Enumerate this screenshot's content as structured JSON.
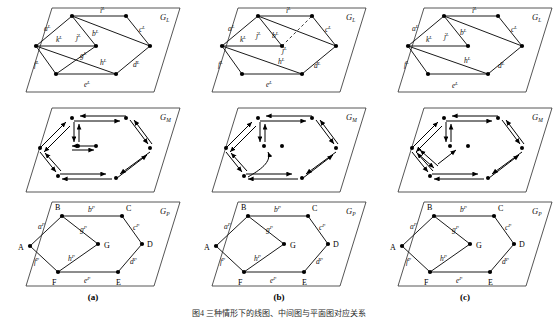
{
  "figure": {
    "caption": "图4 三种情形下的线图、中间图与平面图对应关系",
    "columns": [
      {
        "key": "a",
        "label": "(a)"
      },
      {
        "key": "b",
        "label": "(b)"
      },
      {
        "key": "c",
        "label": "(c)"
      }
    ],
    "rows": [
      {
        "key": "L",
        "graph_label": "G",
        "graph_sub": "L"
      },
      {
        "key": "M",
        "graph_label": "G",
        "graph_sub": "M"
      },
      {
        "key": "P",
        "graph_label": "G",
        "graph_sub": "P"
      }
    ],
    "colors": {
      "stroke": "#1a1a1a",
      "plane": "#2b2b2b",
      "background": "#ffffff",
      "node": "#000000",
      "dashed": "#3a3a3a"
    }
  },
  "labels": {
    "line_edges": [
      "a",
      "b",
      "c",
      "d",
      "e",
      "f",
      "g",
      "h",
      "i",
      "j",
      "k"
    ],
    "line_superscript": "L",
    "planar_superscript": "P",
    "planar_vertices": [
      "A",
      "B",
      "C",
      "D",
      "E",
      "F",
      "G"
    ],
    "graph_L": "G",
    "graph_L_sub": "L",
    "graph_M": "G",
    "graph_M_sub": "M",
    "graph_P": "G",
    "graph_P_sub": "P"
  },
  "panels": {
    "a_L": {
      "name": "line-graph-a",
      "nodes": {
        "n_top": [
          72,
          16
        ],
        "n_left": [
          36,
          46
        ],
        "n_mid": [
          96,
          46
        ],
        "n_right": [
          150,
          46
        ],
        "n_bl": [
          56,
          74
        ],
        "n_br": [
          116,
          74
        ],
        "n_tr": [
          126,
          16
        ]
      },
      "edges": [
        {
          "id": "aL",
          "from": "n_top",
          "to": "n_left",
          "label": "a",
          "lx": 44,
          "ly": 29
        },
        {
          "id": "kL",
          "from": "n_left",
          "to": "n_mid",
          "label": "k",
          "lx": 59,
          "ly": 40
        },
        {
          "id": "jL",
          "from": "n_top",
          "to": "n_mid",
          "label": "j",
          "lx": 80,
          "ly": 38
        },
        {
          "id": "bL",
          "from": "n_top",
          "to": "n_right",
          "label": "b",
          "lx": 97,
          "ly": 34
        },
        {
          "id": "iL",
          "from": "n_top",
          "to": "n_tr",
          "label": "i",
          "lx": 100,
          "ly": 13
        },
        {
          "id": "cL",
          "from": "n_tr",
          "to": "n_right",
          "label": "c",
          "lx": 141,
          "ly": 31
        },
        {
          "id": "gL",
          "from": "n_left",
          "to": "n_br",
          "label": "g",
          "lx": 88,
          "ly": 56
        },
        {
          "id": "fL",
          "from": "n_left",
          "to": "n_bl",
          "label": "f",
          "lx": 38,
          "ly": 66
        },
        {
          "id": "hL",
          "from": "n_mid",
          "to": "n_bl",
          "label": "h",
          "lx": 103,
          "ly": 64
        },
        {
          "id": "eL",
          "from": "n_bl",
          "to": "n_br",
          "label": "e",
          "lx": 85,
          "ly": 84
        },
        {
          "id": "dL",
          "from": "n_br",
          "to": "n_right",
          "label": "d",
          "lx": 137,
          "ly": 64
        }
      ],
      "dashed": []
    },
    "b_L": {
      "name": "line-graph-b",
      "nodes": {
        "n_top": [
          72,
          16
        ],
        "n_left": [
          36,
          46
        ],
        "n_mid": [
          96,
          46
        ],
        "n_right": [
          150,
          46
        ],
        "n_bl": [
          56,
          74
        ],
        "n_br": [
          116,
          74
        ],
        "n_tr": [
          126,
          16
        ]
      },
      "edges": [
        {
          "id": "aL",
          "from": "n_top",
          "to": "n_left",
          "label": "a",
          "lx": 44,
          "ly": 29
        },
        {
          "id": "kL",
          "from": "n_left",
          "to": "n_mid",
          "label": "k",
          "lx": 59,
          "ly": 40
        },
        {
          "id": "jL_d",
          "from": "n_mid",
          "to": "n_tr",
          "label": "j",
          "lx": 104,
          "ly": 52,
          "dashed": true
        },
        {
          "id": "bL",
          "from": "n_top",
          "to": "n_mid",
          "label": "b",
          "lx": 84,
          "ly": 37
        },
        {
          "id": "iL",
          "from": "n_top",
          "to": "n_tr",
          "label": "i",
          "lx": 100,
          "ly": 13
        },
        {
          "id": "cL",
          "from": "n_tr",
          "to": "n_right",
          "label": "c",
          "lx": 141,
          "ly": 31
        },
        {
          "id": "gL",
          "from": "n_top",
          "to": "n_right",
          "label": "",
          "lx": 0,
          "ly": 0
        },
        {
          "id": "fL",
          "from": "n_left",
          "to": "n_bl",
          "label": "f",
          "lx": 38,
          "ly": 66
        },
        {
          "id": "hL",
          "from": "n_left",
          "to": "n_br",
          "label": "h",
          "lx": 95,
          "ly": 63
        },
        {
          "id": "eL",
          "from": "n_bl",
          "to": "n_br",
          "label": "e",
          "lx": 85,
          "ly": 84
        },
        {
          "id": "dL",
          "from": "n_br",
          "to": "n_right",
          "label": "d",
          "lx": 137,
          "ly": 66
        }
      ]
    },
    "c_L": {
      "name": "line-graph-c",
      "nodes": {
        "n_top": [
          72,
          16
        ],
        "n_left": [
          36,
          46
        ],
        "n_mid": [
          96,
          46
        ],
        "n_right": [
          150,
          46
        ],
        "n_bl": [
          56,
          74
        ],
        "n_br": [
          116,
          74
        ],
        "n_tr": [
          126,
          16
        ]
      },
      "edges": [
        {
          "id": "aL",
          "from": "n_top",
          "to": "n_left",
          "label": "a",
          "lx": 44,
          "ly": 29
        },
        {
          "id": "kL",
          "from": "n_left",
          "to": "n_mid",
          "label": "k",
          "lx": 59,
          "ly": 41
        },
        {
          "id": "jL",
          "from": "n_top",
          "to": "n_mid",
          "label": "j",
          "lx": 78,
          "ly": 38
        },
        {
          "id": "bL",
          "from": "n_top",
          "to": "n_mid",
          "label": "b",
          "lx": 92,
          "ly": 33
        },
        {
          "id": "iL",
          "from": "n_top",
          "to": "n_tr",
          "label": "i",
          "lx": 100,
          "ly": 13
        },
        {
          "id": "cL",
          "from": "n_tr",
          "to": "n_right",
          "label": "c",
          "lx": 141,
          "ly": 31
        },
        {
          "id": "bL2",
          "from": "n_top",
          "to": "n_right",
          "label": "",
          "lx": 0,
          "ly": 0
        },
        {
          "id": "fL",
          "from": "n_left",
          "to": "n_bl",
          "label": "f",
          "lx": 38,
          "ly": 66
        },
        {
          "id": "hL",
          "from": "n_left",
          "to": "n_br",
          "label": "h",
          "lx": 95,
          "ly": 63
        },
        {
          "id": "eL",
          "from": "n_bl",
          "to": "n_br",
          "label": "e",
          "lx": 85,
          "ly": 84
        },
        {
          "id": "dL",
          "from": "n_br",
          "to": "n_right",
          "label": "d",
          "lx": 134,
          "ly": 66
        }
      ]
    },
    "a_M": {
      "name": "medial-graph-a",
      "nodes": [
        [
          72,
          18
        ],
        [
          126,
          18
        ],
        [
          40,
          48
        ],
        [
          96,
          46
        ],
        [
          150,
          48
        ],
        [
          58,
          76
        ],
        [
          116,
          78
        ]
      ],
      "description": "directed medial graph with paired opposite arcs"
    },
    "b_M": {
      "name": "medial-graph-b",
      "nodes": [
        [
          72,
          18
        ],
        [
          126,
          18
        ],
        [
          40,
          48
        ],
        [
          96,
          46
        ],
        [
          150,
          48
        ],
        [
          58,
          76
        ],
        [
          116,
          78
        ]
      ],
      "description": "directed medial graph with curved loop arc"
    },
    "c_M": {
      "name": "medial-graph-c",
      "nodes": [
        [
          72,
          18
        ],
        [
          126,
          18
        ],
        [
          40,
          48
        ],
        [
          96,
          46
        ],
        [
          150,
          48
        ],
        [
          58,
          76
        ],
        [
          116,
          78
        ]
      ],
      "description": "directed medial graph with inner quadrilateral"
    },
    "a_P": {
      "name": "planar-graph-a",
      "vertices": {
        "A": [
          30,
          52
        ],
        "B": [
          62,
          22
        ],
        "C": [
          122,
          22
        ],
        "D": [
          142,
          50
        ],
        "E": [
          118,
          78
        ],
        "F": [
          58,
          78
        ],
        "G": [
          98,
          50
        ]
      },
      "edges": [
        {
          "id": "aP",
          "from": "A",
          "to": "B",
          "label": "a",
          "lx": 42,
          "ly": 34
        },
        {
          "id": "bP",
          "from": "B",
          "to": "C",
          "label": "b",
          "lx": 92,
          "ly": 18
        },
        {
          "id": "cP",
          "from": "C",
          "to": "D",
          "label": "c",
          "lx": 137,
          "ly": 34
        },
        {
          "id": "dP",
          "from": "D",
          "to": "E",
          "label": "d",
          "lx": 136,
          "ly": 68
        },
        {
          "id": "eP",
          "from": "E",
          "to": "F",
          "label": "e",
          "lx": 88,
          "ly": 86
        },
        {
          "id": "fP",
          "from": "F",
          "to": "A",
          "label": "f",
          "lx": 39,
          "ly": 68
        },
        {
          "id": "gP",
          "from": "B",
          "to": "G",
          "label": "g",
          "lx": 84,
          "ly": 36
        },
        {
          "id": "hP",
          "from": "G",
          "to": "F",
          "label": "h",
          "lx": 74,
          "ly": 64
        }
      ],
      "vertex_label_pos": {
        "A": [
          20,
          55
        ],
        "B": [
          57,
          16
        ],
        "C": [
          127,
          16
        ],
        "D": [
          147,
          53
        ],
        "E": [
          118,
          90
        ],
        "F": [
          54,
          90
        ],
        "G": [
          104,
          54
        ]
      }
    },
    "b_P": {
      "name": "planar-graph-b",
      "vertices": {
        "A": [
          30,
          52
        ],
        "B": [
          62,
          22
        ],
        "C": [
          122,
          22
        ],
        "D": [
          142,
          50
        ],
        "E": [
          118,
          78
        ],
        "F": [
          58,
          78
        ],
        "G": [
          98,
          50
        ]
      },
      "edges": [
        {
          "id": "aP",
          "from": "A",
          "to": "B",
          "label": "a",
          "lx": 42,
          "ly": 34
        },
        {
          "id": "bP",
          "from": "B",
          "to": "C",
          "label": "b",
          "lx": 92,
          "ly": 18
        },
        {
          "id": "cP",
          "from": "C",
          "to": "D",
          "label": "c",
          "lx": 137,
          "ly": 34
        },
        {
          "id": "dP",
          "from": "D",
          "to": "E",
          "label": "d",
          "lx": 136,
          "ly": 68
        },
        {
          "id": "eP",
          "from": "E",
          "to": "F",
          "label": "e",
          "lx": 88,
          "ly": 86
        },
        {
          "id": "fP",
          "from": "F",
          "to": "A",
          "label": "f",
          "lx": 39,
          "ly": 68
        },
        {
          "id": "gP",
          "from": "B",
          "to": "G",
          "label": "g",
          "lx": 84,
          "ly": 36
        },
        {
          "id": "hP",
          "from": "G",
          "to": "F",
          "label": "h",
          "lx": 74,
          "ly": 64
        }
      ],
      "vertex_label_pos": {
        "A": [
          20,
          55
        ],
        "B": [
          57,
          16
        ],
        "C": [
          127,
          16
        ],
        "D": [
          147,
          53
        ],
        "E": [
          118,
          90
        ],
        "F": [
          54,
          90
        ],
        "G": [
          104,
          54
        ]
      }
    },
    "c_P": {
      "name": "planar-graph-c",
      "vertices": {
        "A": [
          30,
          52
        ],
        "B": [
          62,
          22
        ],
        "C": [
          122,
          22
        ],
        "D": [
          142,
          50
        ],
        "E": [
          118,
          78
        ],
        "F": [
          58,
          78
        ],
        "G": [
          98,
          50
        ]
      },
      "edges": [
        {
          "id": "aP",
          "from": "A",
          "to": "B",
          "label": "a",
          "lx": 42,
          "ly": 34
        },
        {
          "id": "bP",
          "from": "B",
          "to": "C",
          "label": "b",
          "lx": 92,
          "ly": 18
        },
        {
          "id": "cP",
          "from": "C",
          "to": "D",
          "label": "c",
          "lx": 137,
          "ly": 34
        },
        {
          "id": "dP",
          "from": "D",
          "to": "E",
          "label": "d",
          "lx": 136,
          "ly": 68
        },
        {
          "id": "eP",
          "from": "E",
          "to": "F",
          "label": "e",
          "lx": 88,
          "ly": 86
        },
        {
          "id": "fP",
          "from": "F",
          "to": "A",
          "label": "f",
          "lx": 39,
          "ly": 68
        },
        {
          "id": "gP",
          "from": "B",
          "to": "G",
          "label": "g",
          "lx": 84,
          "ly": 36
        },
        {
          "id": "hP",
          "from": "G",
          "to": "F",
          "label": "h",
          "lx": 74,
          "ly": 64
        }
      ],
      "vertex_label_pos": {
        "A": [
          20,
          55
        ],
        "B": [
          57,
          16
        ],
        "C": [
          127,
          16
        ],
        "D": [
          147,
          53
        ],
        "E": [
          118,
          90
        ],
        "F": [
          54,
          90
        ],
        "G": [
          104,
          54
        ]
      }
    }
  }
}
